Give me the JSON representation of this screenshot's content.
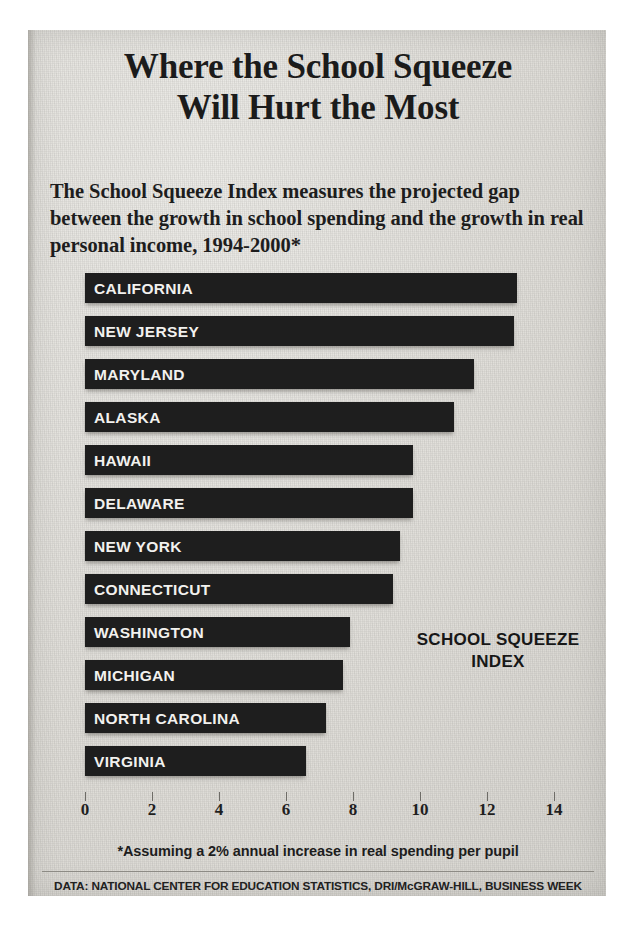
{
  "figure": {
    "title": "Where the School Squeeze Will Hurt the Most",
    "title_line1": "Where the School Squeeze",
    "title_line2": "Will Hurt the Most",
    "subtitle": "The School Squeeze Index measures the projected gap between the growth in school spending and the growth in real personal income, 1994-2000*",
    "index_label_line1": "SCHOOL SQUEEZE",
    "index_label_line2": "INDEX",
    "footnote": "*Assuming a 2% annual increase in real spending per pupil",
    "source": "DATA: NATIONAL CENTER FOR EDUCATION STATISTICS, DRI/McGRAW-HILL, BUSINESS WEEK",
    "colors": {
      "bar": "#1e1e1e",
      "paper": "#dedcd7",
      "bar_text": "#f2f1ee",
      "axis_text": "#1f1f1f"
    }
  },
  "chart_data": {
    "type": "bar",
    "orientation": "horizontal",
    "title": "Where the School Squeeze Will Hurt the Most",
    "subtitle": "The School Squeeze Index measures the projected gap between the growth in school spending and the growth in real personal income, 1994-2000*",
    "xlabel": "School Squeeze Index",
    "ylabel": "",
    "xlim": [
      0,
      14.8
    ],
    "grid": false,
    "legend": false,
    "xticks": [
      0,
      2,
      4,
      6,
      8,
      10,
      12,
      14
    ],
    "xtick_labels": [
      "0",
      "2",
      "4",
      "6",
      "8",
      "10",
      "12",
      "14"
    ],
    "categories": [
      "CALIFORNIA",
      "NEW JERSEY",
      "MARYLAND",
      "ALASKA",
      "HAWAII",
      "DELAWARE",
      "NEW YORK",
      "CONNECTICUT",
      "WASHINGTON",
      "MICHIGAN",
      "NORTH CAROLINA",
      "VIRGINIA"
    ],
    "values": [
      12.9,
      12.8,
      11.6,
      11.0,
      9.8,
      9.8,
      9.4,
      9.2,
      7.9,
      7.7,
      7.2,
      6.6
    ],
    "annotations": [
      "*Assuming a 2% annual increase in real spending per pupil",
      "DATA: NATIONAL CENTER FOR EDUCATION STATISTICS, DRI/McGRAW-HILL, BUSINESS WEEK"
    ]
  }
}
